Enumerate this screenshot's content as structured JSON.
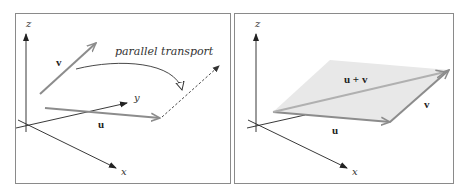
{
  "figure": {
    "left_panel": {
      "axes": {
        "z_label": "z",
        "y_label": "y",
        "x_label": "x"
      },
      "vectors": {
        "v_label": "v",
        "u_label": "u"
      },
      "annotation": "parallel transport"
    },
    "right_panel": {
      "axes": {
        "z_label": "z",
        "x_label": "x"
      },
      "vectors": {
        "u_label": "u",
        "v_label": "v",
        "sum_label": "u + v"
      },
      "plane_fill_color": "#e8e8e8"
    },
    "colors": {
      "axis": "#222222",
      "vector": "#8c8c8c",
      "border": "#8a8a8a"
    }
  }
}
